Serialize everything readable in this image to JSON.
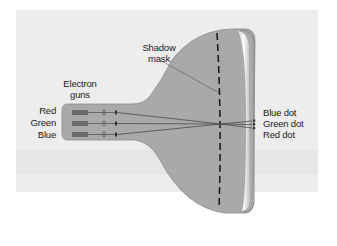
{
  "diagram": {
    "labels": {
      "shadow_mask_line1": "Shadow",
      "shadow_mask_line2": "mask",
      "electron_guns_line1": "Electron",
      "electron_guns_line2": "guns",
      "gun_red": "Red",
      "gun_green": "Green",
      "gun_blue": "Blue",
      "dot_blue": "Blue dot",
      "dot_green": "Green dot",
      "dot_red": "Red dot"
    },
    "colors": {
      "background_panel": "#ededed",
      "tube_body": "#a9a9a9",
      "tube_outline": "#8c8c8c",
      "screen_face": "#f4f4f4",
      "mask_dash": "#1e1e1e",
      "beam": "#505050",
      "gun_block": "#6a6a6a",
      "text": "#222222"
    }
  }
}
